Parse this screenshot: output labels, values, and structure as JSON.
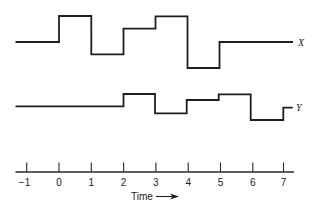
{
  "diagram": {
    "type": "timing-diagram",
    "time_axis": {
      "label": "Time",
      "arrow": "→",
      "ticks": [
        -1,
        0,
        1,
        2,
        3,
        4,
        5,
        6,
        7
      ],
      "tick_labels": [
        "−1",
        "0",
        "1",
        "2",
        "3",
        "4",
        "5",
        "6",
        "7"
      ]
    },
    "signals": [
      {
        "name": "X",
        "levels_description": "step waveform; relative level per interval (higher = up)",
        "steps": [
          {
            "from": "start",
            "to": 0,
            "level": 0
          },
          {
            "from": 0,
            "to": 1,
            "level": 2
          },
          {
            "from": 1,
            "to": 2,
            "level": -1
          },
          {
            "from": 2,
            "to": 3,
            "level": 1
          },
          {
            "from": 3,
            "to": 4,
            "level": 2
          },
          {
            "from": 4,
            "to": 5,
            "level": -2
          },
          {
            "from": 5,
            "to": "end",
            "level": 0
          }
        ]
      },
      {
        "name": "Y",
        "levels_description": "step waveform; relative level per interval (higher = up)",
        "steps": [
          {
            "from": "start",
            "to": 2,
            "level": 0
          },
          {
            "from": 2,
            "to": 3,
            "level": 1
          },
          {
            "from": 3,
            "to": 4,
            "level": -0.6
          },
          {
            "from": 4,
            "to": 5,
            "level": 0.5
          },
          {
            "from": 5,
            "to": 6,
            "level": 1
          },
          {
            "from": 6,
            "to": 7,
            "level": -1.2
          },
          {
            "from": 7,
            "to": "end",
            "level": -0.1
          }
        ]
      }
    ]
  }
}
